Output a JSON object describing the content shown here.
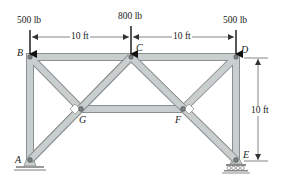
{
  "diagram": {
    "type": "truss",
    "colors": {
      "member_fill": "#c9cfcf",
      "member_edge": "#8a9090",
      "pin": "#6f7777",
      "ground": "#9a9a9a",
      "text": "#1a1a1a"
    },
    "loads": [
      {
        "node": "B",
        "label": "500 lb"
      },
      {
        "node": "C",
        "label": "800 lb"
      },
      {
        "node": "D",
        "label": "500 lb"
      }
    ],
    "dimensions": {
      "horizontal": [
        {
          "from": "B",
          "to": "C",
          "label": "10 ft"
        },
        {
          "from": "C",
          "to": "D",
          "label": "10 ft"
        }
      ],
      "vertical": {
        "from": "D",
        "to": "E",
        "label": "10 ft"
      }
    },
    "nodes": [
      {
        "id": "A",
        "label": "A"
      },
      {
        "id": "B",
        "label": "B"
      },
      {
        "id": "C",
        "label": "C"
      },
      {
        "id": "D",
        "label": "D"
      },
      {
        "id": "E",
        "label": "E"
      },
      {
        "id": "F",
        "label": "F"
      },
      {
        "id": "G",
        "label": "G"
      }
    ],
    "members": [
      "AB",
      "BC",
      "CD",
      "DE",
      "AG",
      "GC",
      "BG",
      "GF",
      "CF",
      "FE",
      "DF"
    ],
    "supports": [
      {
        "node": "A",
        "type": "pin"
      },
      {
        "node": "E",
        "type": "roller"
      }
    ]
  }
}
